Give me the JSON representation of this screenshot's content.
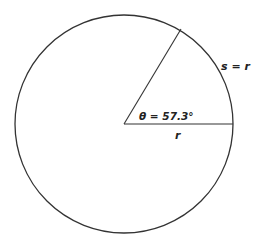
{
  "diagram": {
    "circle": {
      "cx": 124,
      "cy": 124,
      "r": 109
    },
    "labels": {
      "angle": "θ = 57.3°",
      "radius": "r",
      "arc": "s = r"
    },
    "colors": {
      "stroke": "#333333",
      "text": "#222222",
      "background": "#ffffff"
    }
  }
}
